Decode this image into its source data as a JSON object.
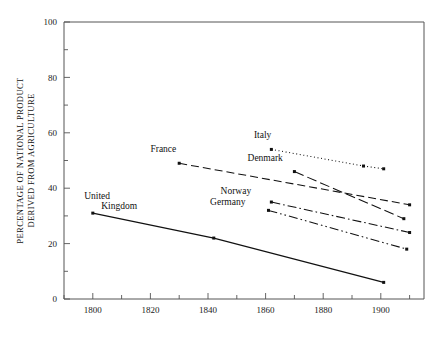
{
  "chart_data": {
    "type": "line",
    "title": "",
    "xlabel": "",
    "ylabel_line1": "PERCENTAGE OF NATIONAL PRODUCT",
    "ylabel_line2": "DERIVED FROM AGRICULTURE",
    "xlim": [
      1790,
      1915
    ],
    "ylim": [
      0,
      100
    ],
    "xticks": [
      1800,
      1820,
      1840,
      1860,
      1880,
      1900
    ],
    "xticklabels": [
      "1800",
      "1820",
      "1840",
      "1860",
      "1880",
      "1900"
    ],
    "xminorticks": [
      1790,
      1810,
      1830,
      1850,
      1870,
      1890,
      1910
    ],
    "yticks": [
      0,
      20,
      40,
      60,
      80,
      100
    ],
    "yticklabels": [
      "0",
      "20",
      "40",
      "60",
      "80",
      "100"
    ],
    "yminorticks": [
      10,
      30,
      50,
      70,
      90
    ],
    "grid": false,
    "legend": "inline-labels",
    "series": [
      {
        "name": "Italy",
        "label": "Italy",
        "style": "dotted",
        "label_x": 1862,
        "label_y": 58,
        "points": [
          {
            "x": 1862,
            "y": 54
          },
          {
            "x": 1894,
            "y": 48
          },
          {
            "x": 1901,
            "y": 47
          }
        ]
      },
      {
        "name": "France",
        "label": "France",
        "style": "dashed",
        "label_x": 1829,
        "label_y": 53,
        "points": [
          {
            "x": 1830,
            "y": 49
          },
          {
            "x": 1910,
            "y": 34
          }
        ]
      },
      {
        "name": "Denmark",
        "label": "Denmark",
        "style": "long-dash",
        "label_x": 1866,
        "label_y": 50,
        "points": [
          {
            "x": 1870,
            "y": 46
          },
          {
            "x": 1908,
            "y": 29
          }
        ]
      },
      {
        "name": "Norway",
        "label": "Norway",
        "style": "dash-dot",
        "label_x": 1855,
        "label_y": 38,
        "points": [
          {
            "x": 1862,
            "y": 35
          },
          {
            "x": 1910,
            "y": 24
          }
        ]
      },
      {
        "name": "Germany",
        "label": "Germany",
        "style": "dash-dot-dot",
        "label_x": 1853,
        "label_y": 34,
        "points": [
          {
            "x": 1861,
            "y": 32
          },
          {
            "x": 1909,
            "y": 18
          }
        ]
      },
      {
        "name": "United Kingdom",
        "label_line1": "United",
        "label_line2": "Kingdom",
        "style": "solid",
        "label_x": 1797,
        "label_y": 36,
        "points": [
          {
            "x": 1800,
            "y": 31
          },
          {
            "x": 1842,
            "y": 22
          },
          {
            "x": 1901,
            "y": 6
          }
        ]
      }
    ]
  }
}
